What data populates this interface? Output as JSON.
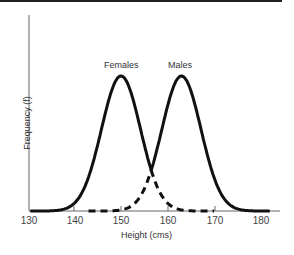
{
  "chart_data": {
    "type": "line",
    "title": "",
    "xlabel": "Height (cms)",
    "ylabel": "Frequency (f)",
    "xlim": [
      130,
      182
    ],
    "x_ticks": [
      "130",
      "140",
      "150",
      "160",
      "170",
      "180"
    ],
    "series": [
      {
        "name": "Females",
        "mean": 150,
        "sd": 4.2,
        "style": "solid then dashed beyond crossing"
      },
      {
        "name": "Males",
        "mean": 163,
        "sd": 4.2,
        "style": "dashed then solid beyond crossing"
      }
    ],
    "annotations": [
      "Females",
      "Males"
    ],
    "grid": false,
    "legend": "inline labels above peaks"
  },
  "labels": {
    "females": "Females",
    "males": "Males",
    "xlabel": "Height (cms)",
    "ylabel": "Frequency (f)"
  },
  "ticks": [
    "130",
    "140",
    "150",
    "160",
    "170",
    "180"
  ]
}
